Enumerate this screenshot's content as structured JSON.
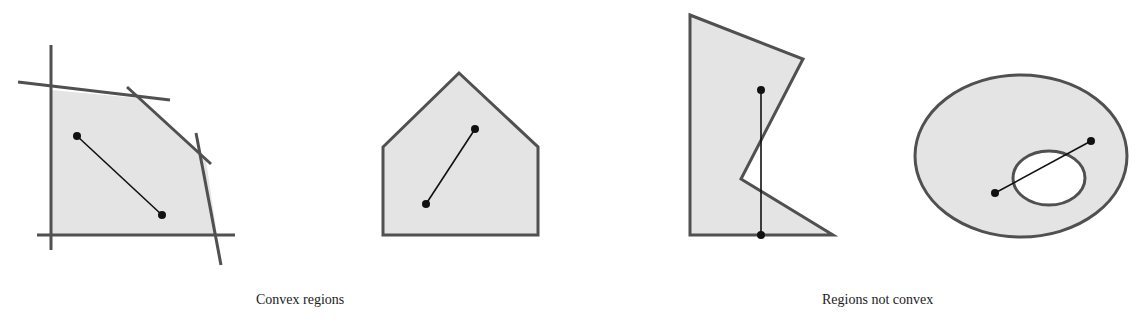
{
  "colors": {
    "fill": "#e4e4e4",
    "stroke": "#505050",
    "segment": "#111111",
    "hole": "#ffffff"
  },
  "captions": {
    "convex": "Convex regions",
    "not_convex": "Regions not convex"
  },
  "figures": [
    {
      "id": "half-plane-intersection",
      "group": "convex",
      "polygon": [
        [
          51,
          90
        ],
        [
          137,
          98
        ],
        [
          206,
          160
        ],
        [
          217,
          235
        ],
        [
          51,
          235
        ]
      ],
      "lines": [
        [
          [
            51,
            45
          ],
          [
            51,
            250
          ]
        ],
        [
          [
            37,
            235
          ],
          [
            235,
            235
          ]
        ],
        [
          [
            18,
            82
          ],
          [
            170,
            100
          ]
        ],
        [
          [
            127,
            87
          ],
          [
            211,
            164
          ]
        ],
        [
          [
            196,
            133
          ],
          [
            221,
            265
          ]
        ]
      ],
      "segment": [
        [
          77,
          136
        ],
        [
          162,
          215
        ]
      ]
    },
    {
      "id": "pentagon",
      "group": "convex",
      "polygon": [
        [
          383,
          147
        ],
        [
          459,
          73
        ],
        [
          538,
          147
        ],
        [
          538,
          235
        ],
        [
          383,
          235
        ]
      ],
      "segment": [
        [
          475,
          129
        ],
        [
          426,
          204
        ]
      ]
    },
    {
      "id": "notched-polygon",
      "group": "not_convex",
      "polygon": [
        [
          690,
          15
        ],
        [
          803,
          59
        ],
        [
          741,
          179
        ],
        [
          833,
          235
        ],
        [
          690,
          235
        ]
      ],
      "segment": [
        [
          761,
          90
        ],
        [
          761,
          235
        ]
      ]
    },
    {
      "id": "ring",
      "group": "not_convex",
      "outer": {
        "cx": 1021,
        "cy": 156,
        "rx": 106,
        "ry": 81
      },
      "hole": {
        "cx": 1049,
        "cy": 178,
        "rx": 36,
        "ry": 27
      },
      "segment": [
        [
          995,
          193
        ],
        [
          1091,
          141
        ]
      ]
    }
  ]
}
